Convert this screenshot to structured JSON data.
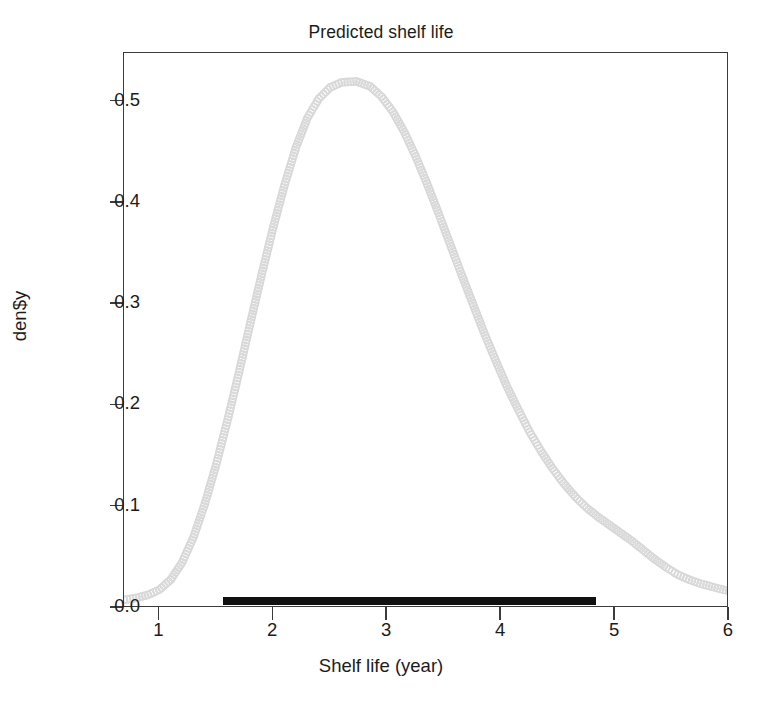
{
  "chart_data": {
    "type": "line",
    "title": "Predicted shelf life",
    "xlabel": "Shelf life (year)",
    "ylabel": "den$y",
    "xlim": [
      0.69,
      6.0
    ],
    "ylim": [
      0.0,
      0.548
    ],
    "xticks": [
      1,
      2,
      3,
      4,
      5,
      6
    ],
    "xtick_labels": [
      "1",
      "2",
      "3",
      "4",
      "5",
      "6"
    ],
    "yticks": [
      0.0,
      0.1,
      0.2,
      0.3,
      0.4,
      0.5
    ],
    "ytick_labels": [
      "0.0",
      "0.1",
      "0.2",
      "0.3",
      "0.4",
      "0.5"
    ],
    "grid": false,
    "legend": false,
    "marker": "open-circle",
    "series": [
      {
        "name": "density",
        "color": "#d8d8d8",
        "x": [
          0.69,
          0.8,
          0.9,
          1.0,
          1.1,
          1.2,
          1.3,
          1.4,
          1.5,
          1.6,
          1.7,
          1.8,
          1.9,
          2.0,
          2.1,
          2.2,
          2.3,
          2.4,
          2.5,
          2.6,
          2.73,
          2.85,
          2.95,
          3.05,
          3.15,
          3.25,
          3.35,
          3.45,
          3.55,
          3.65,
          3.75,
          3.85,
          3.95,
          4.05,
          4.15,
          4.25,
          4.35,
          4.45,
          4.55,
          4.65,
          4.75,
          4.85,
          4.95,
          5.05,
          5.15,
          5.25,
          5.35,
          5.45,
          5.55,
          5.65,
          5.75,
          5.85,
          5.95,
          6.0
        ],
        "y": [
          0.008,
          0.01,
          0.013,
          0.018,
          0.028,
          0.045,
          0.07,
          0.103,
          0.142,
          0.186,
          0.233,
          0.282,
          0.33,
          0.376,
          0.418,
          0.455,
          0.484,
          0.503,
          0.514,
          0.519,
          0.52,
          0.515,
          0.505,
          0.49,
          0.47,
          0.446,
          0.419,
          0.39,
          0.36,
          0.33,
          0.301,
          0.272,
          0.245,
          0.219,
          0.196,
          0.174,
          0.155,
          0.138,
          0.123,
          0.11,
          0.099,
          0.09,
          0.082,
          0.074,
          0.066,
          0.057,
          0.048,
          0.04,
          0.033,
          0.028,
          0.024,
          0.021,
          0.018,
          0.017
        ]
      }
    ],
    "annotations": [
      {
        "name": "credible-interval-bar",
        "type": "horizontal-bar",
        "x_start": 1.57,
        "x_end": 4.84,
        "y": 0.006,
        "color": "#111111"
      }
    ]
  },
  "figure": {
    "background": "#ffffff",
    "box_color": "#3c3c3c"
  }
}
